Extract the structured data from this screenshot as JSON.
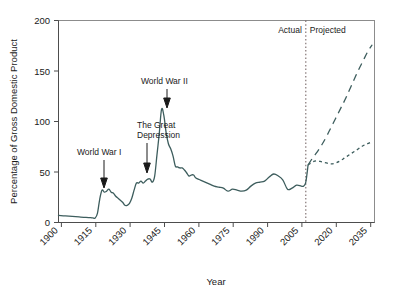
{
  "chart_data": {
    "type": "line",
    "title": "",
    "xlabel": "Year",
    "ylabel": "Percentage of Gross Domestic Product",
    "xlim": [
      1900,
      2038
    ],
    "ylim": [
      0,
      200
    ],
    "xticks": [
      1900,
      1915,
      1930,
      1945,
      1960,
      1975,
      1990,
      2005,
      2020,
      2035
    ],
    "yticks": [
      0,
      50,
      100,
      150,
      200
    ],
    "grid": false,
    "legend": "none",
    "region_labels": [
      {
        "text": "Actual",
        "x": 2005
      },
      {
        "text": "Projected",
        "x": 2012
      }
    ],
    "divider_x": 2008,
    "annotations": [
      {
        "text": "World War I",
        "year": 1918,
        "value": 33
      },
      {
        "text": "The Great Depression",
        "year": 1934,
        "value": 44
      },
      {
        "text": "World War II",
        "year": 1946,
        "value": 112
      }
    ],
    "series": [
      {
        "name": "Actual",
        "style": "solid",
        "x": [
          1900,
          1903,
          1906,
          1909,
          1912,
          1914,
          1915,
          1916,
          1917,
          1918,
          1919,
          1920,
          1921,
          1922,
          1923,
          1924,
          1925,
          1926,
          1927,
          1928,
          1929,
          1930,
          1931,
          1932,
          1933,
          1934,
          1935,
          1936,
          1937,
          1938,
          1939,
          1940,
          1941,
          1942,
          1943,
          1944,
          1945,
          1946,
          1947,
          1948,
          1949,
          1950,
          1951,
          1952,
          1953,
          1954,
          1955,
          1956,
          1957,
          1958,
          1959,
          1960,
          1962,
          1964,
          1966,
          1968,
          1970,
          1972,
          1974,
          1976,
          1978,
          1980,
          1982,
          1984,
          1986,
          1988,
          1990,
          1992,
          1994,
          1996,
          1998,
          2000,
          2002,
          2004,
          2006,
          2007,
          2008,
          2009
        ],
        "y": [
          7,
          6.5,
          6,
          5.5,
          5,
          4.8,
          4.5,
          4.4,
          9,
          23,
          32,
          30,
          31,
          33,
          30,
          29,
          26,
          24,
          22,
          20,
          17,
          17,
          19,
          24,
          32,
          39,
          39,
          41,
          39,
          41,
          43,
          43,
          40,
          46,
          67,
          88,
          112,
          106,
          89,
          78,
          73,
          66,
          56,
          55,
          54,
          54,
          52,
          49,
          46,
          47,
          47,
          44,
          42,
          40,
          38,
          36,
          35,
          34,
          31,
          33,
          32,
          31,
          32,
          36,
          39,
          40,
          41,
          45,
          48,
          46,
          42,
          33,
          34,
          37,
          36,
          36,
          40,
          57
        ]
      },
      {
        "name": "Projected (high / alternative fiscal scenario)",
        "style": "long-dash",
        "x": [
          2009,
          2011,
          2013,
          2015,
          2017,
          2019,
          2021,
          2023,
          2025,
          2027,
          2029,
          2031,
          2033,
          2035,
          2037
        ],
        "y": [
          57,
          64,
          70,
          77,
          85,
          94,
          103,
          112,
          121,
          131,
          141,
          151,
          160,
          169,
          176
        ]
      },
      {
        "name": "Projected (low / extended baseline)",
        "style": "short-dash",
        "x": [
          2009,
          2011,
          2013,
          2015,
          2017,
          2019,
          2021,
          2023,
          2025,
          2027,
          2029,
          2031,
          2033,
          2035,
          2037
        ],
        "y": [
          57,
          60,
          61,
          60,
          59,
          58,
          59,
          61,
          64,
          67,
          70,
          73,
          76,
          78,
          80
        ]
      }
    ]
  }
}
